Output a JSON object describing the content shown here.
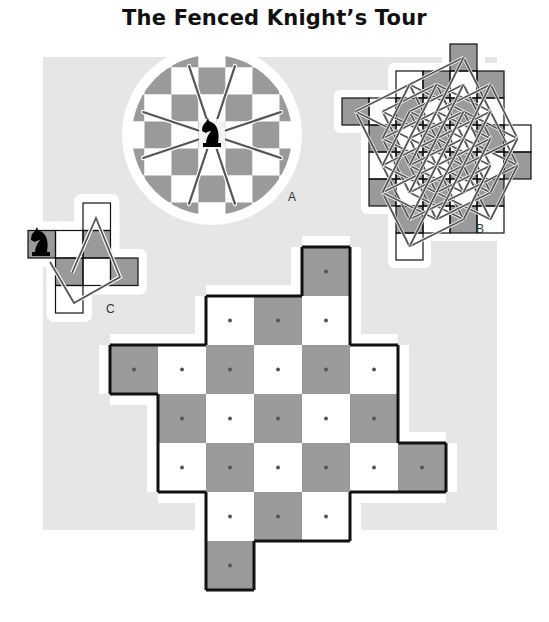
{
  "title": "The Fenced Knight’s Tour",
  "colors": {
    "panel": "#e6e6e6",
    "dark_square": "#9a9a9a",
    "light_square": "#ffffff",
    "fence": "#111111",
    "tour_line": "#555555",
    "dot": "#555555"
  },
  "figures": [
    {
      "id": "A",
      "label": "A",
      "description": "circular board with knight at center and its 8 knight moves"
    },
    {
      "id": "B",
      "label": "B",
      "description": "rotated cross board with complete knight's tour web"
    },
    {
      "id": "C",
      "label": "C",
      "description": "small fenced board with knight and partial tour"
    }
  ],
  "main_board": {
    "cell_size": 48,
    "rows": [
      {
        "row": 0,
        "cols": [
          4
        ]
      },
      {
        "row": 1,
        "cols": [
          2,
          3,
          4
        ]
      },
      {
        "row": 2,
        "cols": [
          0,
          1,
          2,
          3,
          4,
          5
        ]
      },
      {
        "row": 3,
        "cols": [
          1,
          2,
          3,
          4,
          5
        ]
      },
      {
        "row": 4,
        "cols": [
          1,
          2,
          3,
          4,
          5,
          6
        ]
      },
      {
        "row": 5,
        "cols": [
          2,
          3,
          4
        ]
      },
      {
        "row": 6,
        "cols": [
          2
        ]
      }
    ],
    "square_count": 24
  }
}
